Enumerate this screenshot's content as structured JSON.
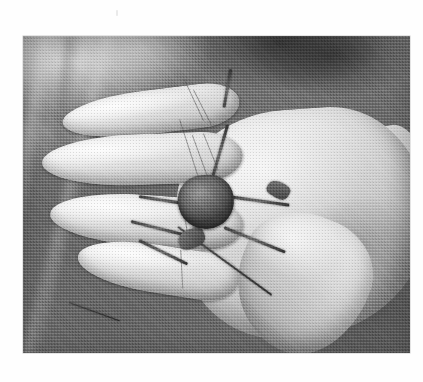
{
  "page": {
    "background_color": "#fefefe",
    "width": 423,
    "height": 382,
    "caption": ""
  },
  "artifact": {
    "name": "scan-speck",
    "description": "faint grey speck near top of page"
  },
  "photograph": {
    "alt": "Black and white halftone photograph of an open human hand, palm down, holding a small crab across the index and middle fingers, against a blurred grassy ground background.",
    "medium": "halftone print scan",
    "color_mode": "grayscale",
    "frame": {
      "x": 23,
      "y": 36,
      "width": 387,
      "height": 317
    },
    "tones": {
      "background_dark": "#6b6b6b",
      "background_light": "#d2d2d2",
      "skin_highlight": "#f4f2ee",
      "skin_midtone": "#cfc8bf",
      "skin_shadow": "#9c948a",
      "crab_shell": "#6d655c",
      "crab_shadow": "#3c3731",
      "frame_border": "#c9c9c9"
    },
    "subjects": [
      {
        "name": "hand",
        "label": "human hand, palm down, fingers spread"
      },
      {
        "name": "crab",
        "label": "small crab perched on fingers"
      },
      {
        "name": "background",
        "label": "blurred grass and ground"
      }
    ],
    "hand": {
      "fingers": [
        {
          "name": "index-finger"
        },
        {
          "name": "middle-finger"
        },
        {
          "name": "ring-finger"
        },
        {
          "name": "little-finger"
        }
      ],
      "thumb": {
        "name": "thumb"
      },
      "palm": {
        "name": "palm"
      },
      "wrist": {
        "name": "wrist"
      }
    },
    "crab": {
      "body": {
        "name": "carapace"
      },
      "legs": [
        {
          "name": "crab-leg-upper-right"
        },
        {
          "name": "crab-leg-right"
        },
        {
          "name": "crab-leg-lower-right"
        },
        {
          "name": "crab-leg-upper-left"
        },
        {
          "name": "crab-leg-left"
        },
        {
          "name": "crab-leg-lower-left"
        },
        {
          "name": "crab-leg-trailing"
        }
      ],
      "claws": [
        {
          "name": "crab-claw-left"
        },
        {
          "name": "crab-claw-right"
        }
      ]
    }
  }
}
